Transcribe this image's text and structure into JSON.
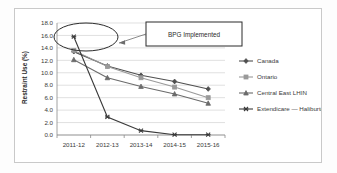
{
  "figure": {
    "annotation": {
      "text": "BPG Implemented",
      "callout_shape": "ellipse",
      "arrow": "leader-line"
    }
  },
  "chart_data": {
    "type": "line",
    "title": "",
    "xlabel": "",
    "ylabel": "Restraint Use (%)",
    "categories": [
      "2011-12",
      "2012-13",
      "2013-14",
      "2014-15",
      "2015-16"
    ],
    "ylim": [
      0.0,
      18.0
    ],
    "ytick_labels": [
      "0.0",
      "2.0",
      "4.0",
      "6.0",
      "8.0",
      "10.0",
      "12.0",
      "14.0",
      "16.0",
      "18.0"
    ],
    "ytick_values": [
      0.0,
      2.0,
      4.0,
      6.0,
      8.0,
      10.0,
      12.0,
      14.0,
      16.0,
      18.0
    ],
    "grid": true,
    "legend_position": "right",
    "series": [
      {
        "name": "Canada",
        "color": "#4f4f4f",
        "marker": "diamond",
        "values": [
          13.4,
          11.1,
          9.6,
          8.6,
          7.4
        ]
      },
      {
        "name": "Ontario",
        "color": "#9a9a9a",
        "marker": "square",
        "values": [
          13.6,
          11.0,
          9.2,
          7.7,
          6.0
        ]
      },
      {
        "name": "Central East LHIN",
        "color": "#6b6b6b",
        "marker": "triangle",
        "values": [
          12.1,
          9.2,
          7.8,
          6.6,
          5.1
        ]
      },
      {
        "name": "Extendicare — Haliburton",
        "color": "#3a3a3a",
        "marker": "cross",
        "values": [
          15.8,
          2.9,
          0.7,
          0.05,
          0.05
        ]
      }
    ]
  }
}
